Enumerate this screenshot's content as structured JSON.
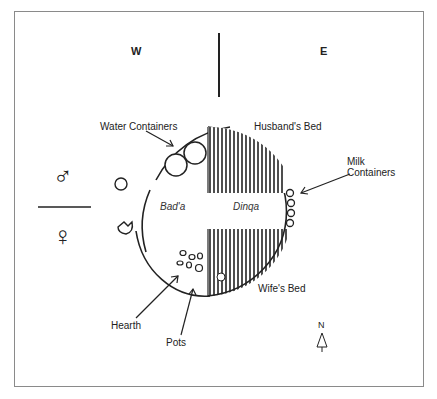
{
  "compass": {
    "west": "W",
    "east": "E",
    "north": "N"
  },
  "gender_symbols": {
    "male": "♂",
    "female": "♀"
  },
  "zones": {
    "west_zone": "Bad'a",
    "east_zone": "Dinqa"
  },
  "labels": {
    "water_containers": "Water Containers",
    "husbands_bed": "Husband's Bed",
    "milk_containers_line1": "Milk",
    "milk_containers_line2": "Containers",
    "wifes_bed": "Wife's Bed",
    "hearth": "Hearth",
    "pots": "Pots"
  },
  "colors": {
    "ink": "#222222",
    "frame": "#8a8a8a",
    "background": "#ffffff"
  }
}
